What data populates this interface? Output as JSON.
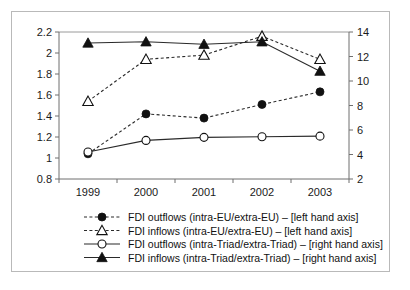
{
  "chart_data": {
    "type": "line",
    "title": "",
    "subtitle": "",
    "xlabel": "",
    "ylabel": "",
    "grid": false,
    "legend_position": "bottom",
    "categories": [
      "1999",
      "2000",
      "2001",
      "2002",
      "2003"
    ],
    "axes": {
      "left": {
        "label": "",
        "ylim": [
          0.8,
          2.2
        ],
        "ticks": [
          "0.8",
          "1",
          "1.2",
          "1.4",
          "1.6",
          "1.8",
          "2",
          "2.2"
        ],
        "tick_values": [
          0.8,
          1.0,
          1.2,
          1.4,
          1.6,
          1.8,
          2.0,
          2.2
        ]
      },
      "right": {
        "label": "",
        "ylim": [
          2,
          14
        ],
        "ticks": [
          "2",
          "4",
          "6",
          "8",
          "10",
          "12",
          "14"
        ],
        "tick_values": [
          2,
          4,
          6,
          8,
          10,
          12,
          14
        ]
      },
      "x": {
        "label": "",
        "ticks": [
          "1999",
          "2000",
          "2001",
          "2002",
          "2003"
        ]
      }
    },
    "series": [
      {
        "name": "FDI outflows (intra-EU/extra-EU) – [left hand axis]",
        "axis": "left",
        "marker": "filled-circle",
        "line": "dashed",
        "color": "#111111",
        "values": [
          1.04,
          1.42,
          1.38,
          1.51,
          1.63
        ]
      },
      {
        "name": "FDI inflows (intra-EU/extra-EU) – [left hand axis]",
        "axis": "left",
        "marker": "open-triangle",
        "line": "dashed",
        "color": "#111111",
        "values": [
          1.54,
          1.94,
          1.98,
          2.16,
          1.94
        ]
      },
      {
        "name": "FDI outflows (intra-Triad/extra-Triad) – [right hand axis]",
        "axis": "right",
        "marker": "open-circle",
        "line": "solid",
        "color": "#111111",
        "values": [
          4.2,
          5.15,
          5.4,
          5.45,
          5.5
        ]
      },
      {
        "name": "FDI inflows (intra-Triad/extra-Triad) – [right hand axis]",
        "axis": "right",
        "marker": "filled-triangle",
        "line": "solid",
        "color": "#111111",
        "values": [
          13.1,
          13.2,
          13.0,
          13.2,
          10.8
        ]
      }
    ]
  },
  "legend": {
    "entries": [
      {
        "label": "FDI outflows (intra-EU/extra-EU) – [left hand axis]"
      },
      {
        "label": "FDI inflows (intra-EU/extra-EU) – [left hand axis]"
      },
      {
        "label": "FDI outflows (intra-Triad/extra-Triad) – [right hand axis]"
      },
      {
        "label": "FDI inflows (intra-Triad/extra-Triad) – [right hand axis]"
      }
    ]
  }
}
